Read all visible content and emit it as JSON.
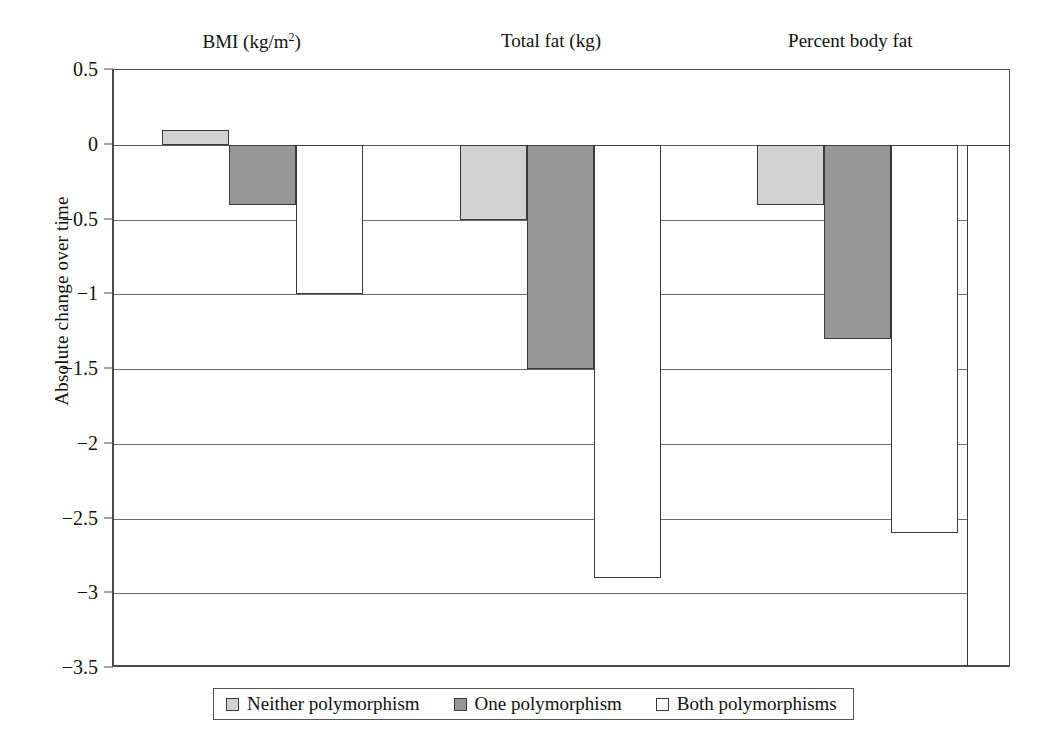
{
  "chart_data": {
    "type": "bar",
    "title": "",
    "xlabel": "",
    "ylabel": "Absolute change over time",
    "ylim": [
      -3.5,
      0.5
    ],
    "ytick_labels": [
      "0.5",
      "0",
      "−0.5",
      "−1",
      "−1.5",
      "−2",
      "−2.5",
      "−3",
      "−3.5"
    ],
    "ytick_values": [
      0.5,
      0,
      -0.5,
      -1,
      -1.5,
      -2,
      -2.5,
      -3,
      -3.5
    ],
    "grid": true,
    "legend_position": "bottom",
    "categories": [
      "BMI (kg/m2)",
      "Total fat (kg)",
      "Percent body fat"
    ],
    "category_labels": [
      {
        "text_before": "BMI (kg/m",
        "sup": "2",
        "text_after": ")"
      },
      {
        "text_before": "Total fat (kg)",
        "sup": "",
        "text_after": ""
      },
      {
        "text_before": "Percent body fat",
        "sup": "",
        "text_after": ""
      }
    ],
    "series": [
      {
        "name": "Neither polymorphism",
        "color": "#d2d2d2",
        "values": [
          0.1,
          -0.5,
          -0.4
        ]
      },
      {
        "name": "One polymorphism",
        "color": "#969696",
        "values": [
          -0.4,
          -1.5,
          -1.3
        ]
      },
      {
        "name": "Both polymorphisms",
        "color": "#ffffff",
        "values": [
          -1.0,
          -2.9,
          -2.6
        ]
      }
    ],
    "clipped_edge_bar": {
      "note": "partial bar at right plot edge",
      "value": -3.5,
      "color": "#ffffff"
    }
  },
  "legend": {
    "items": [
      {
        "label": "Neither polymorphism",
        "swatch": "neither"
      },
      {
        "label": "One polymorphism",
        "swatch": "one"
      },
      {
        "label": "Both polymorphisms",
        "swatch": "both"
      }
    ]
  }
}
